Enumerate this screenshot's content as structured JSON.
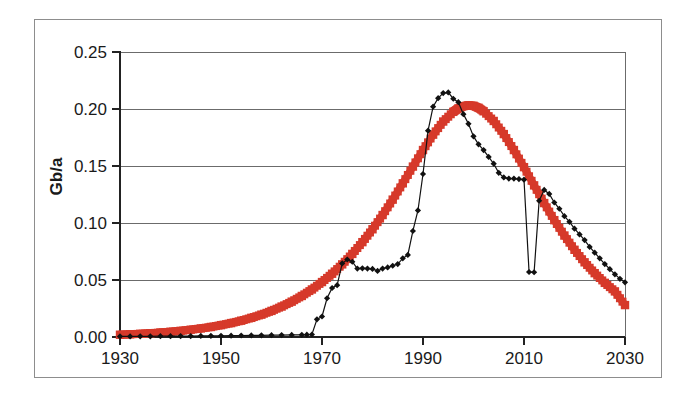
{
  "figure": {
    "name": "oil-production-gb-per-year-chart",
    "background_color": "#ffffff",
    "frame_color": "#8d8d8d"
  },
  "chart_data": {
    "type": "line",
    "title": "",
    "xlabel": "",
    "ylabel": "Gb/a",
    "xlim": [
      1930,
      2030
    ],
    "ylim": [
      0.0,
      0.25
    ],
    "xticks": [
      1930,
      1950,
      1970,
      1990,
      2010,
      2030
    ],
    "xtick_labels": [
      "1930",
      "1950",
      "1970",
      "1990",
      "2010",
      "2030"
    ],
    "yticks": [
      0.0,
      0.05,
      0.1,
      0.15,
      0.2,
      0.25
    ],
    "ytick_labels": [
      "0.00",
      "0.05",
      "0.10",
      "0.15",
      "0.20",
      "0.25"
    ],
    "grid": "horizontal",
    "legend": "none",
    "series": [
      {
        "name": "reported-production",
        "color": "#111111",
        "marker": "diamond",
        "linewidth": 1.2,
        "points": [
          [
            1930,
            0.0005
          ],
          [
            1932,
            0.0005
          ],
          [
            1934,
            0.0006
          ],
          [
            1936,
            0.0006
          ],
          [
            1938,
            0.0007
          ],
          [
            1940,
            0.0007
          ],
          [
            1942,
            0.0008
          ],
          [
            1944,
            0.0008
          ],
          [
            1946,
            0.0009
          ],
          [
            1948,
            0.001
          ],
          [
            1950,
            0.0011
          ],
          [
            1952,
            0.0012
          ],
          [
            1954,
            0.0013
          ],
          [
            1956,
            0.0014
          ],
          [
            1958,
            0.0015
          ],
          [
            1960,
            0.0016
          ],
          [
            1962,
            0.0017
          ],
          [
            1964,
            0.0018
          ],
          [
            1966,
            0.0019
          ],
          [
            1967,
            0.002
          ],
          [
            1968,
            0.0022
          ],
          [
            1969,
            0.0155
          ],
          [
            1970,
            0.018
          ],
          [
            1971,
            0.034
          ],
          [
            1972,
            0.043
          ],
          [
            1973,
            0.0455
          ],
          [
            1974,
            0.0645
          ],
          [
            1975,
            0.068
          ],
          [
            1976,
            0.066
          ],
          [
            1977,
            0.06
          ],
          [
            1978,
            0.0602
          ],
          [
            1979,
            0.06
          ],
          [
            1980,
            0.0597
          ],
          [
            1981,
            0.058
          ],
          [
            1982,
            0.06
          ],
          [
            1983,
            0.061
          ],
          [
            1984,
            0.0625
          ],
          [
            1985,
            0.064
          ],
          [
            1986,
            0.069
          ],
          [
            1987,
            0.072
          ],
          [
            1988,
            0.093
          ],
          [
            1989,
            0.111
          ],
          [
            1990,
            0.143
          ],
          [
            1991,
            0.181
          ],
          [
            1992,
            0.202
          ],
          [
            1993,
            0.2095
          ],
          [
            1994,
            0.214
          ],
          [
            1995,
            0.2145
          ],
          [
            1996,
            0.209
          ],
          [
            1997,
            0.206
          ],
          [
            1998,
            0.1955
          ],
          [
            1999,
            0.187
          ],
          [
            2000,
            0.176
          ],
          [
            2001,
            0.169
          ],
          [
            2002,
            0.164
          ],
          [
            2003,
            0.158
          ],
          [
            2004,
            0.152
          ],
          [
            2005,
            0.144
          ],
          [
            2006,
            0.14
          ],
          [
            2007,
            0.139
          ],
          [
            2008,
            0.139
          ],
          [
            2009,
            0.1385
          ],
          [
            2010,
            0.138
          ],
          [
            2011,
            0.057
          ],
          [
            2012,
            0.0568
          ],
          [
            2013,
            0.1195
          ],
          [
            2014,
            0.129
          ],
          [
            2015,
            0.1255
          ],
          [
            2016,
            0.118
          ],
          [
            2017,
            0.1125
          ],
          [
            2018,
            0.106
          ],
          [
            2019,
            0.101
          ],
          [
            2020,
            0.095
          ],
          [
            2021,
            0.09
          ],
          [
            2022,
            0.085
          ],
          [
            2023,
            0.079
          ],
          [
            2024,
            0.074
          ],
          [
            2025,
            0.069
          ],
          [
            2026,
            0.064
          ],
          [
            2027,
            0.0595
          ],
          [
            2028,
            0.055
          ],
          [
            2029,
            0.051
          ],
          [
            2030,
            0.048
          ]
        ]
      },
      {
        "name": "model-curve",
        "color": "#d6392a",
        "marker": "square",
        "linewidth": 7.5,
        "points": [
          [
            1930,
            0.002
          ],
          [
            1932,
            0.0024
          ],
          [
            1934,
            0.0028
          ],
          [
            1936,
            0.0033
          ],
          [
            1938,
            0.0039
          ],
          [
            1940,
            0.0046
          ],
          [
            1942,
            0.0054
          ],
          [
            1944,
            0.0064
          ],
          [
            1946,
            0.0075
          ],
          [
            1948,
            0.0088
          ],
          [
            1950,
            0.0104
          ],
          [
            1952,
            0.0122
          ],
          [
            1954,
            0.0143
          ],
          [
            1956,
            0.0168
          ],
          [
            1958,
            0.0196
          ],
          [
            1960,
            0.0229
          ],
          [
            1962,
            0.0267
          ],
          [
            1964,
            0.031
          ],
          [
            1966,
            0.036
          ],
          [
            1968,
            0.0417
          ],
          [
            1970,
            0.0482
          ],
          [
            1972,
            0.0555
          ],
          [
            1974,
            0.0637
          ],
          [
            1976,
            0.0729
          ],
          [
            1978,
            0.0832
          ],
          [
            1980,
            0.0945
          ],
          [
            1982,
            0.107
          ],
          [
            1984,
            0.1205
          ],
          [
            1986,
            0.1348
          ],
          [
            1988,
            0.1495
          ],
          [
            1990,
            0.164
          ],
          [
            1992,
            0.1775
          ],
          [
            1994,
            0.189
          ],
          [
            1996,
            0.1975
          ],
          [
            1997,
            0.2005
          ],
          [
            1998,
            0.2025
          ],
          [
            1999,
            0.2032
          ],
          [
            2000,
            0.2028
          ],
          [
            2001,
            0.201
          ],
          [
            2002,
            0.198
          ],
          [
            2004,
            0.1895
          ],
          [
            2006,
            0.178
          ],
          [
            2008,
            0.164
          ],
          [
            2010,
            0.149
          ],
          [
            2012,
            0.133
          ],
          [
            2014,
            0.1175
          ],
          [
            2016,
            0.1025
          ],
          [
            2018,
            0.089
          ],
          [
            2020,
            0.0765
          ],
          [
            2022,
            0.0655
          ],
          [
            2024,
            0.056
          ],
          [
            2026,
            0.0475
          ],
          [
            2028,
            0.04
          ],
          [
            2030,
            0.028
          ]
        ]
      }
    ]
  }
}
